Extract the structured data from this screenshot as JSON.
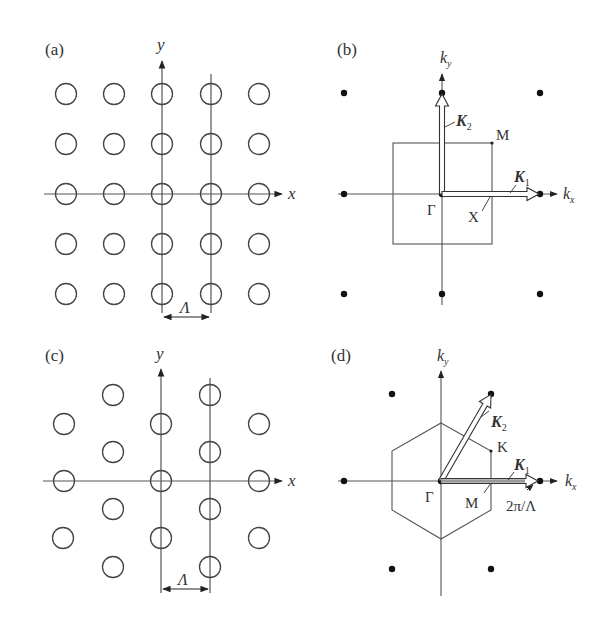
{
  "figure": {
    "panels": [
      {
        "id": "a",
        "label": "(a)",
        "type": "real-space square lattice",
        "axes": {
          "x": "x",
          "y": "y"
        },
        "lattice_constant_label": "Λ"
      },
      {
        "id": "b",
        "label": "(b)",
        "type": "reciprocal square lattice / Brillouin zone",
        "axes": {
          "x": "k",
          "x_sub": "x",
          "y": "k",
          "y_sub": "y"
        },
        "points": {
          "gamma": "Γ",
          "x": "X",
          "m": "M"
        },
        "vectors": {
          "k1": "K",
          "k1_sub": "1",
          "k2": "K",
          "k2_sub": "2"
        }
      },
      {
        "id": "c",
        "label": "(c)",
        "type": "real-space triangular lattice",
        "axes": {
          "x": "x",
          "y": "y"
        },
        "lattice_constant_label": "Λ"
      },
      {
        "id": "d",
        "label": "(d)",
        "type": "reciprocal triangular lattice / hexagonal Brillouin zone",
        "axes": {
          "x": "k",
          "x_sub": "x",
          "y": "k",
          "y_sub": "y"
        },
        "points": {
          "gamma": "Γ",
          "m": "M",
          "k": "K"
        },
        "vectors": {
          "k1": "K",
          "k1_sub": "1",
          "k2": "K",
          "k2_sub": "2"
        },
        "magnitude_label": "2π/Λ"
      }
    ],
    "colors": {
      "line": "#555555",
      "ink": "#222222",
      "background": "#ffffff"
    }
  }
}
